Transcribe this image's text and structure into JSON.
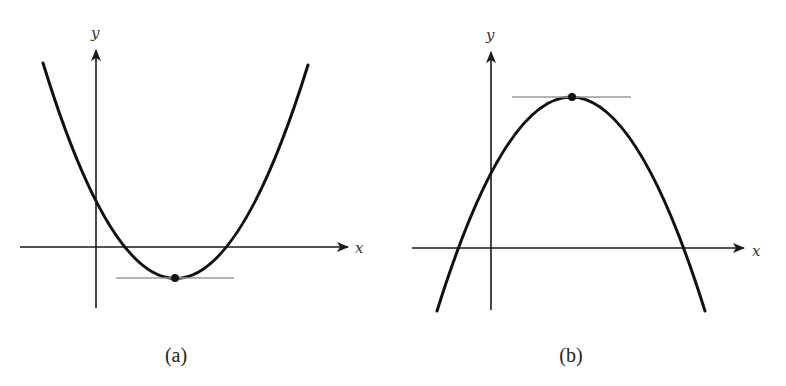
{
  "figure": {
    "panels": [
      {
        "id": "a",
        "caption": "(a)",
        "x_label": "x",
        "y_label": "y",
        "curve_type": "upward parabola",
        "extremum": "minimum",
        "tangent": "horizontal tangent line at minimum point"
      },
      {
        "id": "b",
        "caption": "(b)",
        "x_label": "x",
        "y_label": "y",
        "curve_type": "downward parabola",
        "extremum": "maximum",
        "tangent": "horizontal tangent line at maximum point"
      }
    ],
    "colors": {
      "curve": "#111111",
      "axes": "#1a1a1a",
      "tangent": "#9a9a9a",
      "background": "#ffffff"
    }
  }
}
